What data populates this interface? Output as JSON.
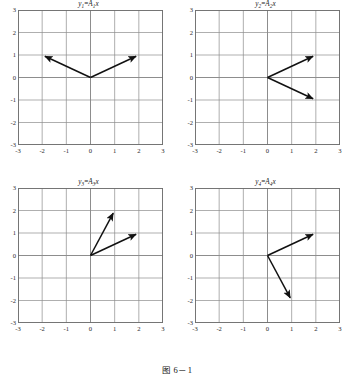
{
  "caption": "图 6－1",
  "colors": {
    "grid": "#8d8d8d",
    "frame": "#6f6f6f",
    "vector": "#111111",
    "text": "#1a1a1a",
    "background": "#ffffff"
  },
  "axes": {
    "xticks": [
      "-3",
      "-2",
      "-1",
      "0",
      "1",
      "2",
      "3"
    ],
    "yticks": [
      "3",
      "2",
      "1",
      "0",
      "-1",
      "-2",
      "-3"
    ],
    "xlim": [
      -3,
      3
    ],
    "ylim": [
      -3,
      3
    ],
    "grid": true
  },
  "chart_data": [
    {
      "type": "scatter",
      "id": "panel-1",
      "title": "y1=A1x",
      "title_base": "y",
      "title_sub": "1",
      "title_eq": "=",
      "title_matrix": "A",
      "title_matrix_sub": "1",
      "title_var": "x",
      "xlabel": "",
      "ylabel": "",
      "xlim": [
        -3,
        3
      ],
      "ylim": [
        -3,
        3
      ],
      "xticks": [
        "-3",
        "-2",
        "-1",
        "0",
        "1",
        "2",
        "3"
      ],
      "yticks": [
        "3",
        "2",
        "1",
        "0",
        "-1",
        "-2",
        "-3"
      ],
      "grid": true,
      "vectors": [
        {
          "name": "vector-a",
          "from": [
            0,
            0
          ],
          "to": [
            -2,
            1
          ]
        },
        {
          "name": "vector-b",
          "from": [
            0,
            0
          ],
          "to": [
            2,
            1
          ]
        }
      ]
    },
    {
      "type": "scatter",
      "id": "panel-2",
      "title": "y2=A2x",
      "title_base": "y",
      "title_sub": "2",
      "title_eq": "=",
      "title_matrix": "A",
      "title_matrix_sub": "2",
      "title_var": "x",
      "xlabel": "",
      "ylabel": "",
      "xlim": [
        -3,
        3
      ],
      "ylim": [
        -3,
        3
      ],
      "xticks": [
        "-3",
        "-2",
        "-1",
        "0",
        "1",
        "2",
        "3"
      ],
      "yticks": [
        "3",
        "2",
        "1",
        "0",
        "-1",
        "-2",
        "-3"
      ],
      "grid": true,
      "vectors": [
        {
          "name": "vector-a",
          "from": [
            0,
            0
          ],
          "to": [
            2,
            1
          ]
        },
        {
          "name": "vector-b",
          "from": [
            0,
            0
          ],
          "to": [
            2,
            -1
          ]
        }
      ]
    },
    {
      "type": "scatter",
      "id": "panel-3",
      "title": "y3=A3x",
      "title_base": "y",
      "title_sub": "3",
      "title_eq": "=",
      "title_matrix": "A",
      "title_matrix_sub": "3",
      "title_var": "x",
      "xlabel": "",
      "ylabel": "",
      "xlim": [
        -3,
        3
      ],
      "ylim": [
        -3,
        3
      ],
      "xticks": [
        "-3",
        "-2",
        "-1",
        "0",
        "1",
        "2",
        "3"
      ],
      "yticks": [
        "3",
        "2",
        "1",
        "0",
        "-1",
        "-2",
        "-3"
      ],
      "grid": true,
      "vectors": [
        {
          "name": "vector-a",
          "from": [
            0,
            0
          ],
          "to": [
            1,
            2
          ]
        },
        {
          "name": "vector-b",
          "from": [
            0,
            0
          ],
          "to": [
            2,
            1
          ]
        }
      ]
    },
    {
      "type": "scatter",
      "id": "panel-4",
      "title": "y4=A4x",
      "title_base": "y",
      "title_sub": "4",
      "title_eq": "=",
      "title_matrix": "A",
      "title_matrix_sub": "4",
      "title_var": "x",
      "xlabel": "",
      "ylabel": "",
      "xlim": [
        -3,
        3
      ],
      "ylim": [
        -3,
        3
      ],
      "xticks": [
        "-3",
        "-2",
        "-1",
        "0",
        "1",
        "2",
        "3"
      ],
      "yticks": [
        "3",
        "2",
        "1",
        "0",
        "-1",
        "-2",
        "-3"
      ],
      "grid": true,
      "vectors": [
        {
          "name": "vector-a",
          "from": [
            0,
            0
          ],
          "to": [
            2,
            1
          ]
        },
        {
          "name": "vector-b",
          "from": [
            0,
            0
          ],
          "to": [
            1,
            -2
          ]
        }
      ]
    }
  ]
}
